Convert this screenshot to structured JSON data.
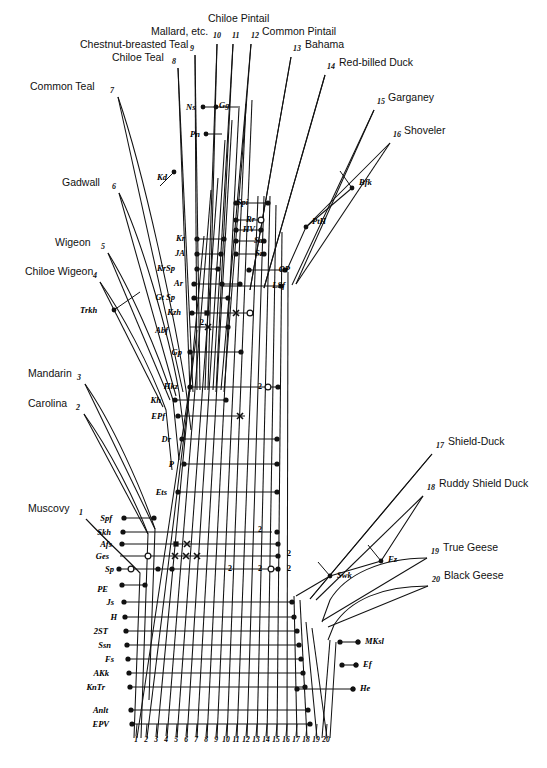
{
  "figure": {
    "background_color": "#ffffff",
    "line_color": "#111111"
  },
  "taxa": [
    {
      "num": "1",
      "label": "Muscovy",
      "side": "left",
      "lx": 28,
      "ly": 512,
      "nx": 79,
      "ny": 515,
      "tipx": 86,
      "tipy": 519,
      "basex": 140,
      "basey": 573
    },
    {
      "num": "2",
      "label": "Carolina",
      "side": "left",
      "lx": 28,
      "ly": 407,
      "nx": 76,
      "ny": 410,
      "tipx": 84,
      "tipy": 414,
      "basex": 148,
      "basey": 534
    },
    {
      "num": "3",
      "label": "Mandarin",
      "side": "left",
      "lx": 28,
      "ly": 377,
      "nx": 77,
      "ny": 380,
      "tipx": 85,
      "tipy": 384,
      "basex": 155,
      "basey": 529
    },
    {
      "num": "4",
      "label": "Chiloe Wigeon",
      "side": "left",
      "lx": 25,
      "ly": 275,
      "nx": 93,
      "ny": 278,
      "tipx": 100,
      "tipy": 282,
      "basex": 163,
      "basey": 407
    },
    {
      "num": "5",
      "label": "Wigeon",
      "side": "left",
      "lx": 55,
      "ly": 246,
      "nx": 101,
      "ny": 249,
      "tipx": 108,
      "tipy": 253,
      "basex": 170,
      "basey": 400
    },
    {
      "num": "6",
      "label": "Gadwall",
      "side": "left",
      "lx": 62,
      "ly": 186,
      "nx": 112,
      "ny": 189,
      "tipx": 119,
      "tipy": 193,
      "basex": 176,
      "basey": 396
    },
    {
      "num": "7",
      "label": "Common Teal",
      "side": "left",
      "lx": 30,
      "ly": 90,
      "nx": 110,
      "ny": 93,
      "tipx": 118,
      "tipy": 97,
      "basex": 183,
      "basey": 392
    },
    {
      "num": "8",
      "label": "Chiloe Teal",
      "side": "left",
      "lx": 112,
      "ly": 61,
      "nx": 172,
      "ny": 64,
      "tipx": 178,
      "tipy": 68,
      "basex": 190,
      "basey": 392
    },
    {
      "num": "9",
      "label": "Chestnut-breasted Teal",
      "side": "left",
      "lx": 80,
      "ly": 48,
      "nx": 190,
      "ny": 51,
      "tipx": 195,
      "tipy": 55,
      "basex": 197,
      "basey": 390
    },
    {
      "num": "10",
      "label": "Mallard, etc.",
      "side": "left",
      "lx": 151,
      "ly": 35,
      "nx": 213,
      "ny": 38,
      "tipx": 217,
      "tipy": 44,
      "basex": 205,
      "basey": 390
    },
    {
      "num": "11",
      "label": "Chiloe Pintail",
      "side": "top",
      "lx": 208,
      "ly": 22,
      "nx": 232,
      "ny": 38,
      "tipx": 233,
      "tipy": 44,
      "basex": 213,
      "basey": 390
    },
    {
      "num": "12",
      "label": "Common Pintail",
      "side": "right",
      "lx": 262,
      "ly": 35,
      "nx": 251,
      "ny": 38,
      "tipx": 251,
      "tipy": 44,
      "basex": 221,
      "basey": 390
    },
    {
      "num": "13",
      "label": "Bahama",
      "side": "right",
      "lx": 305,
      "ly": 48,
      "nx": 293,
      "ny": 51,
      "tipx": 291,
      "tipy": 57,
      "basex": 250,
      "basey": 290
    },
    {
      "num": "14",
      "label": "Red-billed Duck",
      "side": "right",
      "lx": 339,
      "ly": 66,
      "nx": 327,
      "ny": 69,
      "tipx": 325,
      "tipy": 75,
      "basex": 264,
      "basey": 288
    },
    {
      "num": "15",
      "label": "Garganey",
      "side": "right",
      "lx": 388,
      "ly": 101,
      "nx": 377,
      "ny": 104,
      "tipx": 374,
      "tipy": 110,
      "basex": 292,
      "basey": 285
    },
    {
      "num": "16",
      "label": "Shoveler",
      "side": "right",
      "lx": 404,
      "ly": 134,
      "nx": 393,
      "ny": 137,
      "tipx": 390,
      "tipy": 143,
      "basex": 296,
      "basey": 284
    },
    {
      "num": "17",
      "label": "Shield-Duck",
      "side": "right",
      "lx": 448,
      "ly": 445,
      "nx": 436,
      "ny": 448,
      "tipx": 432,
      "tipy": 454,
      "basex": 310,
      "basey": 599
    },
    {
      "num": "18",
      "label": "Ruddy Shield Duck",
      "side": "right",
      "lx": 439,
      "ly": 487,
      "nx": 427,
      "ny": 490,
      "tipx": 423,
      "tipy": 496,
      "basex": 316,
      "basey": 600
    },
    {
      "num": "19",
      "label": "True Geese",
      "side": "right",
      "lx": 443,
      "ly": 551,
      "nx": 431,
      "ny": 554,
      "tipx": 427,
      "tipy": 558,
      "basex": 322,
      "basey": 621
    },
    {
      "num": "20",
      "label": "Black Geese",
      "side": "right",
      "lx": 444,
      "ly": 579,
      "nx": 432,
      "ny": 582,
      "tipx": 428,
      "tipy": 586,
      "basex": 328,
      "basey": 627
    }
  ],
  "character_rows": [
    {
      "code": "Spi",
      "lx": 248,
      "ly": 205,
      "x1": 236,
      "x2": 268,
      "y": 203
    },
    {
      "code": "Rr",
      "lx": 255,
      "ly": 222,
      "x1": 236,
      "x2": 262,
      "y": 220
    },
    {
      "code": "HV",
      "lx": 255,
      "ly": 232,
      "x1": 236,
      "x2": 262,
      "y": 230
    },
    {
      "code": "Sa",
      "lx": 263,
      "ly": 243,
      "x1": 236,
      "x2": 266,
      "y": 241
    },
    {
      "code": "Sz",
      "lx": 263,
      "ly": 256,
      "x1": 236,
      "x2": 266,
      "y": 254
    },
    {
      "code": "OP",
      "lx": 290,
      "ly": 272,
      "x1": 249,
      "x2": 286,
      "y": 270
    },
    {
      "code": "LSf",
      "lx": 285,
      "ly": 288,
      "x1": 222,
      "x2": 281,
      "y": 286
    },
    {
      "code": "Kr",
      "lx": 185,
      "ly": 241,
      "x1": 197,
      "x2": 225,
      "y": 239
    },
    {
      "code": "JA",
      "lx": 185,
      "ly": 256,
      "x1": 197,
      "x2": 222,
      "y": 254
    },
    {
      "code": "KrSp",
      "lx": 175,
      "ly": 271,
      "x1": 197,
      "x2": 219,
      "y": 269
    },
    {
      "code": "Ar",
      "lx": 183,
      "ly": 286,
      "x1": 194,
      "x2": 240,
      "y": 284
    },
    {
      "code": "Gt Sp",
      "lx": 175,
      "ly": 300,
      "x1": 194,
      "x2": 229,
      "y": 298
    },
    {
      "code": "Kzh",
      "lx": 181,
      "ly": 315,
      "x1": 192,
      "x2": 250,
      "y": 313
    },
    {
      "code": "Abf",
      "lx": 168,
      "ly": 333,
      "x1": 190,
      "x2": 229,
      "y": 327
    },
    {
      "code": "Gp",
      "lx": 182,
      "ly": 355,
      "x1": 190,
      "x2": 241,
      "y": 352
    },
    {
      "code": "Hkz",
      "lx": 178,
      "ly": 389,
      "x1": 190,
      "x2": 278,
      "y": 387
    },
    {
      "code": "Kh",
      "lx": 161,
      "ly": 403,
      "x1": 175,
      "x2": 226,
      "y": 400
    },
    {
      "code": "EPf",
      "lx": 165,
      "ly": 419,
      "x1": 178,
      "x2": 245,
      "y": 416
    },
    {
      "code": "Dr",
      "lx": 171,
      "ly": 442,
      "x1": 182,
      "x2": 277,
      "y": 439
    },
    {
      "code": "P",
      "lx": 174,
      "ly": 467,
      "x1": 184,
      "x2": 277,
      "y": 464
    },
    {
      "code": "Ets",
      "lx": 167,
      "ly": 495,
      "x1": 178,
      "x2": 277,
      "y": 492
    },
    {
      "code": "Spf",
      "lx": 112,
      "ly": 521,
      "x1": 124,
      "x2": 154,
      "y": 518
    },
    {
      "code": "Skh",
      "lx": 111,
      "ly": 535,
      "x1": 123,
      "x2": 272,
      "y": 532
    },
    {
      "code": "Afs",
      "lx": 112,
      "ly": 547,
      "x1": 122,
      "x2": 278,
      "y": 544
    },
    {
      "code": "Ges",
      "lx": 109,
      "ly": 559,
      "x1": 120,
      "x2": 278,
      "y": 556
    },
    {
      "code": "Sp",
      "lx": 114,
      "ly": 572,
      "x1": 119,
      "x2": 278,
      "y": 569
    },
    {
      "code": "PE",
      "lx": 108,
      "ly": 592,
      "x1": 122,
      "x2": 145,
      "y": 585
    },
    {
      "code": "Js",
      "lx": 114,
      "ly": 605,
      "x1": 124,
      "x2": 292,
      "y": 602
    },
    {
      "code": "H",
      "lx": 117,
      "ly": 620,
      "x1": 125,
      "x2": 294,
      "y": 617
    },
    {
      "code": "2ST",
      "lx": 108,
      "ly": 634,
      "x1": 126,
      "x2": 297,
      "y": 631
    },
    {
      "code": "Ssn",
      "lx": 111,
      "ly": 648,
      "x1": 127,
      "x2": 299,
      "y": 645
    },
    {
      "code": "Fs",
      "lx": 114,
      "ly": 662,
      "x1": 128,
      "x2": 301,
      "y": 659
    },
    {
      "code": "AKk",
      "lx": 109,
      "ly": 676,
      "x1": 129,
      "x2": 303,
      "y": 673
    },
    {
      "code": "KnTr",
      "lx": 105,
      "ly": 690,
      "x1": 130,
      "x2": 305,
      "y": 687
    },
    {
      "code": "Anlt",
      "lx": 108,
      "ly": 713,
      "x1": 131,
      "x2": 308,
      "y": 710
    },
    {
      "code": "EPV",
      "lx": 109,
      "ly": 727,
      "x1": 132,
      "x2": 310,
      "y": 724
    }
  ],
  "node_codes": [
    {
      "code": "Ns",
      "lx": 186,
      "ly": 110,
      "px": 203,
      "py": 107
    },
    {
      "code": "Gg",
      "lx": 219,
      "ly": 108,
      "px": 216,
      "py": 107
    },
    {
      "code": "Pn",
      "lx": 190,
      "ly": 137,
      "px": 206,
      "py": 134
    },
    {
      "code": "Kd",
      "lx": 157,
      "ly": 180,
      "px": 174,
      "py": 172
    },
    {
      "code": "Bfk",
      "lx": 359,
      "ly": 185,
      "px": 352,
      "py": 188
    },
    {
      "code": "PtH",
      "lx": 312,
      "ly": 224,
      "px": 306,
      "py": 227
    },
    {
      "code": "Trkh",
      "lx": 80,
      "ly": 313,
      "px": 114,
      "py": 310
    },
    {
      "code": "Fz",
      "lx": 388,
      "ly": 562,
      "px": 381,
      "py": 561
    },
    {
      "code": "Swk",
      "lx": 337,
      "ly": 578,
      "px": 330,
      "py": 576
    },
    {
      "code": "MKsl",
      "lx": 365,
      "ly": 644,
      "px": 358,
      "py": 642
    },
    {
      "code": "Ef",
      "lx": 363,
      "ly": 667,
      "px": 356,
      "py": 665
    },
    {
      "code": "He",
      "lx": 360,
      "ly": 691,
      "px": 353,
      "py": 689
    }
  ],
  "axis": {
    "label": "column index",
    "numbers": [
      "1",
      "2",
      "3",
      "4",
      "5",
      "6",
      "7",
      "8",
      "9",
      "10",
      "11",
      "12",
      "13",
      "14",
      "15",
      "16",
      "17",
      "18",
      "19",
      "20"
    ],
    "y": 742,
    "tick_top": 724,
    "tick_bottom": 736
  },
  "columns": [
    {
      "n": "1",
      "top_x": 190,
      "top_y": 384,
      "bot_x": 137,
      "bot_y": 738
    },
    {
      "n": "2",
      "top_x": 197,
      "top_y": 330,
      "bot_x": 147,
      "bot_y": 738
    },
    {
      "n": "3",
      "top_x": 204,
      "top_y": 236,
      "bot_x": 157,
      "bot_y": 738
    },
    {
      "n": "4",
      "top_x": 211,
      "top_y": 190,
      "bot_x": 167,
      "bot_y": 738
    },
    {
      "n": "5",
      "top_x": 218,
      "top_y": 178,
      "bot_x": 177,
      "bot_y": 738
    },
    {
      "n": "6",
      "top_x": 225,
      "top_y": 140,
      "bot_x": 187,
      "bot_y": 738
    },
    {
      "n": "7",
      "top_x": 232,
      "top_y": 120,
      "bot_x": 197,
      "bot_y": 738
    },
    {
      "n": "8",
      "top_x": 239,
      "top_y": 108,
      "bot_x": 207,
      "bot_y": 738
    },
    {
      "n": "9",
      "top_x": 246,
      "top_y": 104,
      "bot_x": 217,
      "bot_y": 738
    },
    {
      "n": "10",
      "top_x": 252,
      "top_y": 100,
      "bot_x": 227,
      "bot_y": 738
    },
    {
      "n": "11",
      "top_x": 258,
      "top_y": 196,
      "bot_x": 237,
      "bot_y": 738
    },
    {
      "n": "12",
      "top_x": 264,
      "top_y": 196,
      "bot_x": 247,
      "bot_y": 738
    },
    {
      "n": "13",
      "top_x": 270,
      "top_y": 196,
      "bot_x": 257,
      "bot_y": 738
    },
    {
      "n": "14",
      "top_x": 276,
      "top_y": 205,
      "bot_x": 267,
      "bot_y": 738
    },
    {
      "n": "15",
      "top_x": 282,
      "top_y": 232,
      "bot_x": 277,
      "bot_y": 738
    },
    {
      "n": "16",
      "top_x": 288,
      "top_y": 272,
      "bot_x": 287,
      "bot_y": 738
    },
    {
      "n": "17",
      "top_x": 294,
      "top_y": 596,
      "bot_x": 297,
      "bot_y": 738
    },
    {
      "n": "18",
      "top_x": 300,
      "top_y": 600,
      "bot_x": 307,
      "bot_y": 738
    },
    {
      "n": "19",
      "top_x": 306,
      "top_y": 622,
      "bot_x": 317,
      "bot_y": 738
    },
    {
      "n": "20",
      "top_x": 312,
      "top_y": 628,
      "bot_x": 327,
      "bot_y": 738
    }
  ],
  "markers": {
    "dot": "filled-circle",
    "open": "open-circle",
    "square": "filled-square",
    "cross": "x-mark",
    "digit": "numeral"
  },
  "marker_points": [
    {
      "type": "dot",
      "x": 236,
      "y": 203
    },
    {
      "type": "dot",
      "x": 268,
      "y": 203
    },
    {
      "type": "dot",
      "x": 236,
      "y": 220
    },
    {
      "type": "open",
      "x": 261,
      "y": 220
    },
    {
      "type": "dot",
      "x": 236,
      "y": 230
    },
    {
      "type": "dot",
      "x": 261,
      "y": 230
    },
    {
      "type": "dot",
      "x": 236,
      "y": 241
    },
    {
      "type": "dot",
      "x": 264,
      "y": 241
    },
    {
      "type": "dot",
      "x": 236,
      "y": 254
    },
    {
      "type": "dot",
      "x": 264,
      "y": 254
    },
    {
      "type": "dot",
      "x": 249,
      "y": 270
    },
    {
      "type": "dot",
      "x": 285,
      "y": 270
    },
    {
      "type": "dot",
      "x": 222,
      "y": 284
    },
    {
      "type": "dot",
      "x": 281,
      "y": 286
    },
    {
      "type": "dot",
      "x": 197,
      "y": 239
    },
    {
      "type": "dot",
      "x": 224,
      "y": 239
    },
    {
      "type": "dot",
      "x": 197,
      "y": 254
    },
    {
      "type": "dot",
      "x": 221,
      "y": 254
    },
    {
      "type": "dot",
      "x": 197,
      "y": 269
    },
    {
      "type": "dot",
      "x": 218,
      "y": 269
    },
    {
      "type": "dot",
      "x": 194,
      "y": 284
    },
    {
      "type": "dot",
      "x": 240,
      "y": 284
    },
    {
      "type": "dot",
      "x": 194,
      "y": 298
    },
    {
      "type": "dot",
      "x": 228,
      "y": 298
    },
    {
      "type": "dot",
      "x": 192,
      "y": 313
    },
    {
      "type": "square",
      "x": 207,
      "y": 313
    },
    {
      "type": "cross",
      "x": 236,
      "y": 313
    },
    {
      "type": "open",
      "x": 250,
      "y": 313
    },
    {
      "type": "cross",
      "x": 208,
      "y": 327
    },
    {
      "type": "dot",
      "x": 228,
      "y": 327
    },
    {
      "type": "dot",
      "x": 190,
      "y": 352
    },
    {
      "type": "dot",
      "x": 241,
      "y": 352
    },
    {
      "type": "dot",
      "x": 190,
      "y": 387
    },
    {
      "type": "open",
      "x": 268,
      "y": 387
    },
    {
      "type": "dot",
      "x": 278,
      "y": 387
    },
    {
      "type": "dot",
      "x": 175,
      "y": 400
    },
    {
      "type": "dot",
      "x": 226,
      "y": 400
    },
    {
      "type": "dot",
      "x": 178,
      "y": 416
    },
    {
      "type": "cross",
      "x": 240,
      "y": 416
    },
    {
      "type": "dot",
      "x": 182,
      "y": 439
    },
    {
      "type": "dot",
      "x": 277,
      "y": 439
    },
    {
      "type": "dot",
      "x": 184,
      "y": 464
    },
    {
      "type": "dot",
      "x": 277,
      "y": 464
    },
    {
      "type": "dot",
      "x": 178,
      "y": 492
    },
    {
      "type": "dot",
      "x": 277,
      "y": 492
    },
    {
      "type": "dot",
      "x": 124,
      "y": 518
    },
    {
      "type": "dot",
      "x": 154,
      "y": 518
    },
    {
      "type": "dot",
      "x": 123,
      "y": 532
    },
    {
      "type": "dot",
      "x": 277,
      "y": 532
    },
    {
      "type": "dot",
      "x": 122,
      "y": 544
    },
    {
      "type": "square",
      "x": 176,
      "y": 544
    },
    {
      "type": "cross",
      "x": 187,
      "y": 544
    },
    {
      "type": "dot",
      "x": 278,
      "y": 544
    },
    {
      "type": "open",
      "x": 148,
      "y": 556
    },
    {
      "type": "cross",
      "x": 175,
      "y": 556
    },
    {
      "type": "cross",
      "x": 186,
      "y": 556
    },
    {
      "type": "cross",
      "x": 197,
      "y": 556
    },
    {
      "type": "dot",
      "x": 278,
      "y": 556
    },
    {
      "type": "dot",
      "x": 119,
      "y": 569
    },
    {
      "type": "open",
      "x": 131,
      "y": 569
    },
    {
      "type": "dot",
      "x": 158,
      "y": 569
    },
    {
      "type": "dot",
      "x": 172,
      "y": 569
    },
    {
      "type": "open",
      "x": 271,
      "y": 569
    },
    {
      "type": "dot",
      "x": 278,
      "y": 569
    },
    {
      "type": "dot",
      "x": 122,
      "y": 585
    },
    {
      "type": "dot",
      "x": 145,
      "y": 585
    },
    {
      "type": "dot",
      "x": 124,
      "y": 602
    },
    {
      "type": "dot",
      "x": 292,
      "y": 602
    },
    {
      "type": "dot",
      "x": 125,
      "y": 617
    },
    {
      "type": "dot",
      "x": 294,
      "y": 617
    },
    {
      "type": "dot",
      "x": 126,
      "y": 631
    },
    {
      "type": "dot",
      "x": 297,
      "y": 631
    },
    {
      "type": "dot",
      "x": 127,
      "y": 645
    },
    {
      "type": "dot",
      "x": 299,
      "y": 645
    },
    {
      "type": "dot",
      "x": 128,
      "y": 659
    },
    {
      "type": "dot",
      "x": 301,
      "y": 659
    },
    {
      "type": "dot",
      "x": 129,
      "y": 673
    },
    {
      "type": "dot",
      "x": 303,
      "y": 673
    },
    {
      "type": "dot",
      "x": 130,
      "y": 687
    },
    {
      "type": "dot",
      "x": 305,
      "y": 687
    },
    {
      "type": "dot",
      "x": 131,
      "y": 710
    },
    {
      "type": "dot",
      "x": 308,
      "y": 710
    },
    {
      "type": "dot",
      "x": 132,
      "y": 724
    },
    {
      "type": "dot",
      "x": 310,
      "y": 724
    },
    {
      "type": "dot",
      "x": 297,
      "y": 689
    },
    {
      "type": "dot",
      "x": 353,
      "y": 689
    },
    {
      "type": "dot",
      "x": 340,
      "y": 642
    },
    {
      "type": "dot",
      "x": 358,
      "y": 642
    },
    {
      "type": "dot",
      "x": 342,
      "y": 665
    },
    {
      "type": "dot",
      "x": 356,
      "y": 665
    }
  ],
  "marker_digits": [
    {
      "text": "2",
      "x": 200,
      "y": 325
    },
    {
      "text": "2",
      "x": 258,
      "y": 389
    },
    {
      "text": "2",
      "x": 258,
      "y": 532
    },
    {
      "text": "2",
      "x": 287,
      "y": 556
    },
    {
      "text": "2",
      "x": 228,
      "y": 571
    },
    {
      "text": "2",
      "x": 258,
      "y": 571
    },
    {
      "text": "2",
      "x": 287,
      "y": 571
    }
  ]
}
